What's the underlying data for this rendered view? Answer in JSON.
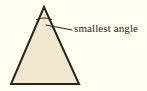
{
  "figure": {
    "kind": "geometry-diagram",
    "background_color": "#FFFDF0",
    "stroke_color": "#2A2520",
    "annotation": {
      "label": "smallest angle",
      "leader_line": {
        "from_x": 46,
        "from_y": 25,
        "to_x": 72,
        "to_y": 30
      }
    },
    "triangle": {
      "fill_color": "#F2E8D0",
      "stroke_color": "#2A2520",
      "stroke_width": 2,
      "vertices": [
        {
          "name": "apex",
          "x": 44,
          "y": 7
        },
        {
          "name": "bottom-right",
          "x": 79,
          "y": 84
        },
        {
          "name": "bottom-left",
          "x": 11,
          "y": 84
        }
      ],
      "points_attr": "44,7 79,84 11,84"
    },
    "angle_arc": {
      "at_vertex": "apex",
      "path_attr": "M 36.5,19.5 Q 44,16.5 51.5,19.5",
      "stroke_width": 1.2
    }
  }
}
